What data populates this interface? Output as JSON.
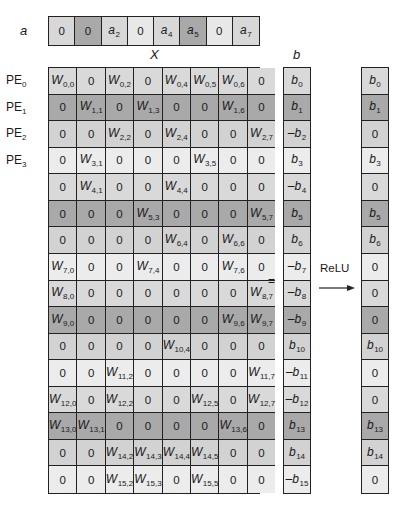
{
  "labels": {
    "a": "a",
    "matrix": "X",
    "b": "b",
    "equals": "=",
    "relu": "ReLU"
  },
  "pe_labels": [
    {
      "base": "PE",
      "sub": "0"
    },
    {
      "base": "PE",
      "sub": "1"
    },
    {
      "base": "PE",
      "sub": "2"
    },
    {
      "base": "PE",
      "sub": "3"
    }
  ],
  "a_vector": [
    {
      "text": "0",
      "shade": "light"
    },
    {
      "text": "0",
      "shade": "dark"
    },
    {
      "text": "a",
      "sub": "2",
      "shade": "light"
    },
    {
      "text": "0",
      "shade": "lighter"
    },
    {
      "text": "a",
      "sub": "4",
      "shade": "light"
    },
    {
      "text": "a",
      "sub": "5",
      "shade": "dark"
    },
    {
      "text": "0",
      "shade": "lighter"
    },
    {
      "text": "a",
      "sub": "7",
      "shade": "light"
    }
  ],
  "row_shades": [
    0,
    1,
    2,
    3,
    0,
    1,
    2,
    3,
    0,
    1,
    2,
    3,
    0,
    1,
    2,
    3
  ],
  "matrix": [
    [
      "W0,0",
      "0",
      "W0,2",
      "0",
      "W0,4",
      "W0,5",
      "W0,6",
      "0"
    ],
    [
      "0",
      "W1,1",
      "0",
      "W1,3",
      "0",
      "0",
      "W1,6",
      "0"
    ],
    [
      "0",
      "0",
      "W2,2",
      "0",
      "W2,4",
      "0",
      "0",
      "W2,7"
    ],
    [
      "0",
      "W3,1",
      "0",
      "0",
      "0",
      "W3,5",
      "0",
      "0"
    ],
    [
      "0",
      "W4,1",
      "0",
      "0",
      "W4,4",
      "0",
      "0",
      "0"
    ],
    [
      "0",
      "0",
      "0",
      "W5,3",
      "0",
      "0",
      "0",
      "W5,7"
    ],
    [
      "0",
      "0",
      "0",
      "0",
      "W6,4",
      "0",
      "W6,6",
      "0"
    ],
    [
      "W7,0",
      "0",
      "0",
      "W7,4",
      "0",
      "0",
      "W7,6",
      "0"
    ],
    [
      "W8,0",
      "0",
      "0",
      "0",
      "0",
      "0",
      "0",
      "W8,7"
    ],
    [
      "W9,0",
      "0",
      "0",
      "0",
      "0",
      "0",
      "W9,6",
      "W9,7"
    ],
    [
      "0",
      "0",
      "0",
      "0",
      "W10,4",
      "0",
      "0",
      "0"
    ],
    [
      "0",
      "0",
      "W11,2",
      "0",
      "0",
      "0",
      "0",
      "W11,7"
    ],
    [
      "W12,0",
      "0",
      "W12,2",
      "0",
      "0",
      "W12,5",
      "0",
      "W12,7"
    ],
    [
      "W13,0",
      "W13,1",
      "0",
      "0",
      "0",
      "0",
      "W13,6",
      "0"
    ],
    [
      "0",
      "0",
      "W14,2",
      "W14,3",
      "W14,4",
      "W14,5",
      "0",
      "0"
    ],
    [
      "0",
      "0",
      "W15,2",
      "W15,3",
      "0",
      "W15,5",
      "0",
      "0"
    ]
  ],
  "b_vector": [
    "b0",
    "b1",
    "-b2",
    "b3",
    "-b4",
    "b5",
    "b6",
    "-b7",
    "-b8",
    "-b9",
    "b10",
    "-b11",
    "-b12",
    "b13",
    "b14",
    "-b15"
  ],
  "relu_output": [
    "b0",
    "b1",
    "0",
    "b3",
    "0",
    "b5",
    "b6",
    "0",
    "0",
    "0",
    "b10",
    "0",
    "0",
    "b13",
    "b14",
    "0"
  ]
}
